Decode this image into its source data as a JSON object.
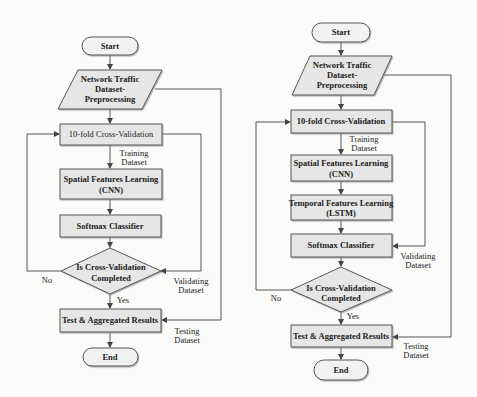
{
  "diagram": {
    "type": "flowchart",
    "colors": {
      "box_fill": "#e6e6e6",
      "terminal_fill": "#f2f2f2",
      "stroke": "#555555",
      "background": "#fbfbfa"
    },
    "left": {
      "start": "Start",
      "input": [
        "Network Traffic",
        "Dataset-",
        "Preprocessing"
      ],
      "cv": "10-fold Cross-Validation",
      "training_label": [
        "Training",
        "Dataset"
      ],
      "spatial": [
        "Spatial Features Learning",
        "(CNN)"
      ],
      "softmax": "Softmax Classifier",
      "decision": [
        "Is Cross-Validation",
        "Completed"
      ],
      "no_label": "No",
      "yes_label": "Yes",
      "validating_label": [
        "Validating",
        "Dataset"
      ],
      "test": "Test & Aggregated Results",
      "testing_label": [
        "Testing",
        "Dataset"
      ],
      "end": "End"
    },
    "right": {
      "start": "Start",
      "input": [
        "Network Traffic",
        "Dataset-",
        "Preprocessing"
      ],
      "cv": "10-fold Cross-Validation",
      "training_label": [
        "Training",
        "Dataset"
      ],
      "spatial": [
        "Spatial Features Learning",
        "(CNN)"
      ],
      "temporal": [
        "Temporal Features Learning",
        "(LSTM)"
      ],
      "softmax": "Softmax Classifier",
      "decision": [
        "Is Cross-Validation",
        "Completed"
      ],
      "no_label": "No",
      "yes_label": "Yes",
      "validating_label": [
        "Validating",
        "Dataset"
      ],
      "test": "Test & Aggregated Results",
      "testing_label": [
        "Testing",
        "Dataset"
      ],
      "end": "End"
    }
  }
}
